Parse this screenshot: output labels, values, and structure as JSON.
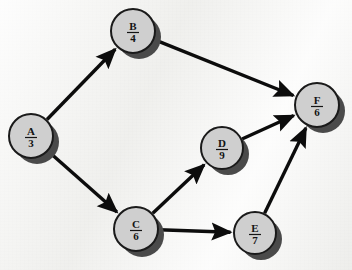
{
  "diagram": {
    "type": "directed-graph",
    "colors": {
      "background": "#f3f3f1",
      "node_fill": "#cfcfcf",
      "node_stroke": "#1a1a1a",
      "node_shadow": "#4a4a4a",
      "edge": "#0c0c0c",
      "text": "#141414"
    },
    "nodes": [
      {
        "id": "A",
        "letter": "A",
        "value": "3",
        "cx": 31,
        "cy": 136,
        "r": 22
      },
      {
        "id": "B",
        "letter": "B",
        "value": "4",
        "cx": 133,
        "cy": 31,
        "r": 22
      },
      {
        "id": "C",
        "letter": "C",
        "value": "6",
        "cx": 136,
        "cy": 229,
        "r": 22
      },
      {
        "id": "D",
        "letter": "D",
        "value": "9",
        "cx": 222,
        "cy": 148,
        "r": 21
      },
      {
        "id": "E",
        "letter": "E",
        "value": "7",
        "cx": 255,
        "cy": 233,
        "r": 21
      },
      {
        "id": "F",
        "letter": "F",
        "value": "6",
        "cx": 317,
        "cy": 105,
        "r": 22
      }
    ],
    "edges": [
      {
        "from": "A",
        "to": "B",
        "directed": true
      },
      {
        "from": "A",
        "to": "C",
        "directed": true
      },
      {
        "from": "B",
        "to": "F",
        "directed": true
      },
      {
        "from": "C",
        "to": "D",
        "directed": true
      },
      {
        "from": "C",
        "to": "E",
        "directed": true
      },
      {
        "from": "D",
        "to": "F",
        "directed": true
      },
      {
        "from": "E",
        "to": "F",
        "directed": true
      }
    ]
  }
}
